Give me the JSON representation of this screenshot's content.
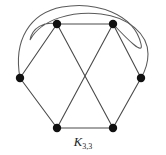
{
  "figure": {
    "name": "complete-bipartite-graph-k33",
    "caption_letter": "K",
    "caption_subscript": "3,3",
    "caption_full": "K3,3",
    "background_color": "#ffffff",
    "edge_color": "#4a4a4a",
    "vertex_color": "#111111",
    "caption_color": "#1a1a1a",
    "width": 166,
    "height": 155
  },
  "graph_data": {
    "type": "graph",
    "name": "K3,3",
    "description": "Complete bipartite graph on 3 + 3 vertices drawn with two curved edges",
    "vertex_count": 6,
    "edge_count": 9,
    "vertex_radius": 3.6,
    "edge_width": 1.1,
    "partition_a": [
      "top-left",
      "right",
      "bottom-left"
    ],
    "partition_b": [
      "top-right",
      "left",
      "bottom-right"
    ],
    "vertices": [
      {
        "id": "top-left",
        "label": "",
        "x": 57,
        "y": 24
      },
      {
        "id": "top-right",
        "label": "",
        "x": 113,
        "y": 24
      },
      {
        "id": "left",
        "label": "",
        "x": 20,
        "y": 78
      },
      {
        "id": "right",
        "label": "",
        "x": 141,
        "y": 78
      },
      {
        "id": "bottom-left",
        "label": "",
        "x": 57,
        "y": 128
      },
      {
        "id": "bottom-right",
        "label": "",
        "x": 113,
        "y": 128
      }
    ],
    "edges": [
      {
        "id": "e-top",
        "from": "top-left",
        "to": "top-right",
        "kind": "straight"
      },
      {
        "id": "e-bottom",
        "from": "bottom-left",
        "to": "bottom-right",
        "kind": "straight"
      },
      {
        "id": "e-left-upper",
        "from": "left",
        "to": "top-left",
        "kind": "straight"
      },
      {
        "id": "e-left-lower",
        "from": "left",
        "to": "bottom-left",
        "kind": "straight"
      },
      {
        "id": "e-right-upper",
        "from": "right",
        "to": "top-right",
        "kind": "straight"
      },
      {
        "id": "e-right-lower",
        "from": "right",
        "to": "bottom-right",
        "kind": "straight"
      },
      {
        "id": "e-diag-1",
        "from": "top-left",
        "to": "bottom-right",
        "kind": "straight"
      },
      {
        "id": "e-diag-2",
        "from": "top-right",
        "to": "bottom-left",
        "kind": "straight"
      },
      {
        "id": "e-arc-outer",
        "from": "left",
        "to": "top-right",
        "kind": "arc",
        "path": "M 20 78 C 18 14, 78 2, 122 11 C 143 16, 120 21, 113 24"
      },
      {
        "id": "e-arc-inner",
        "from": "top-left",
        "to": "right",
        "kind": "arc",
        "path": "M 57 24 C 50 20, 30 18, 36 34 C 50 9, 120 0, 146 40 C 152 54, 143 68, 141 78"
      }
    ],
    "caption": {
      "text": "K3,3",
      "x": 85,
      "y": 141
    }
  }
}
